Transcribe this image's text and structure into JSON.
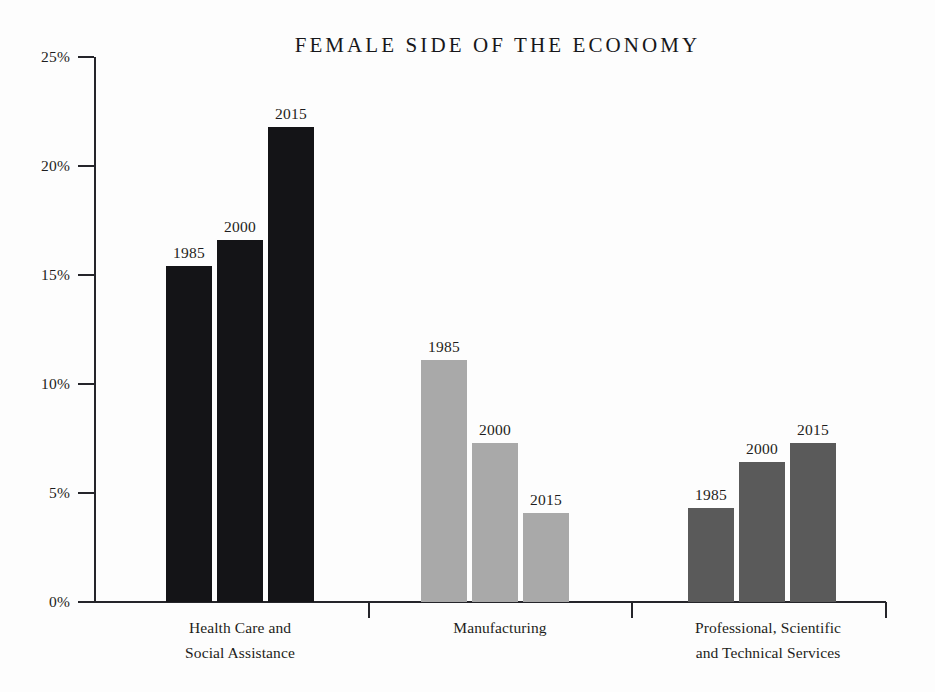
{
  "chart_data": {
    "type": "bar",
    "title": "FEMALE SIDE OF THE ECONOMY",
    "xlabel": "",
    "ylabel": "",
    "ylim": [
      0,
      25
    ],
    "grid": false,
    "legend": "inline-data-labels",
    "value_unit": "percent",
    "categories": [
      "Health Care and Social Assistance",
      "Manufacturing",
      "Professional, Scientific and Technical Services"
    ],
    "category_lines": [
      [
        "Health Care and",
        "Social Assistance"
      ],
      [
        "Manufacturing"
      ],
      [
        "Professional, Scientific",
        "and Technical Services"
      ]
    ],
    "series": [
      {
        "name": "1985",
        "values": [
          15.4,
          11.1,
          4.3
        ]
      },
      {
        "name": "2000",
        "values": [
          16.6,
          7.3,
          6.4
        ]
      },
      {
        "name": "2015",
        "values": [
          21.8,
          4.1,
          7.3
        ]
      }
    ],
    "group_colors": [
      "#141417",
      "#a9a9a9",
      "#5a5a5a"
    ],
    "y_ticks": [
      {
        "value": 0,
        "label": "0%"
      },
      {
        "value": 5,
        "label": "5%"
      },
      {
        "value": 10,
        "label": "10%"
      },
      {
        "value": 15,
        "label": "15%"
      },
      {
        "value": 20,
        "label": "20%"
      },
      {
        "value": 25,
        "label": "25%"
      }
    ],
    "bar_labels": [
      [
        "1985",
        "2000",
        "2015"
      ],
      [
        "1985",
        "2000",
        "2015"
      ],
      [
        "1985",
        "2000",
        "2015"
      ]
    ]
  },
  "axis": {
    "axis_color": "#25252a",
    "background": "#fdfdfd"
  },
  "geometry": {
    "baseline_y": 602,
    "top_y": 57,
    "axis_x": 94,
    "axis_right_x": 886,
    "bar_width": 46,
    "bar_gap": 5,
    "group_starts": [
      166,
      421,
      688
    ],
    "group_separators": [
      368,
      631,
      885
    ],
    "category_centers": [
      240,
      500,
      768
    ]
  }
}
